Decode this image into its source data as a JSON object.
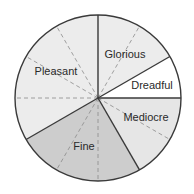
{
  "chart_data": {
    "type": "pie",
    "title": "",
    "total_sections": 12,
    "section_degrees": 30,
    "slices": [
      {
        "label": "Glorious",
        "sections": 2,
        "value": 2,
        "fraction": 0.1667,
        "color": "#ececec"
      },
      {
        "label": "Dreadful",
        "sections": 1,
        "value": 1,
        "fraction": 0.0833,
        "color": "#ffffff"
      },
      {
        "label": "Mediocre",
        "sections": 2,
        "value": 2,
        "fraction": 0.1667,
        "color": "#e6e6e6"
      },
      {
        "label": "Fine",
        "sections": 3,
        "value": 3,
        "fraction": 0.25,
        "color": "#cdcdcd"
      },
      {
        "label": "Pleasant",
        "sections": 4,
        "value": 4,
        "fraction": 0.3333,
        "color": "#ececec"
      }
    ],
    "start_angle": "12 o'clock",
    "direction": "clockwise",
    "grid": "dashed radial lines every 30 degrees",
    "legend": "none (labels inside slices)"
  }
}
